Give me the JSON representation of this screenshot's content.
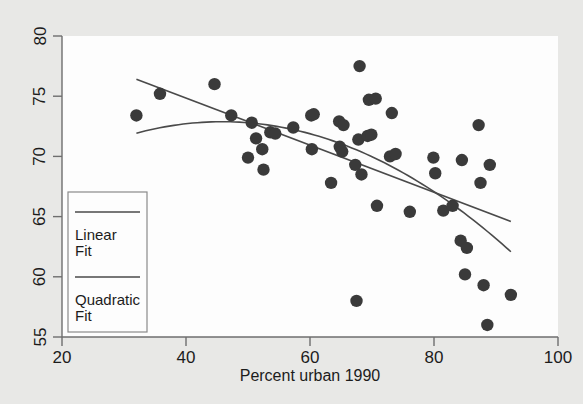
{
  "figure": {
    "background_color": "#e8e8e6",
    "plot_background_color": "#fdfdfd",
    "marker_color": "#3a3a3a",
    "line_color": "#4a4a4a",
    "frame_color": "#6e6e6e"
  },
  "chart_data": {
    "type": "scatter",
    "title": "",
    "xlabel": "Percent urban 1990",
    "ylabel": "",
    "xlim": [
      20,
      100
    ],
    "ylim": [
      55,
      80
    ],
    "xticks": [
      20,
      40,
      60,
      80,
      100
    ],
    "yticks": [
      55,
      60,
      65,
      70,
      75,
      80
    ],
    "xtick_labels": [
      "20",
      "40",
      "60",
      "80",
      "100"
    ],
    "ytick_labels": [
      "55",
      "60",
      "65",
      "70",
      "75",
      "80"
    ],
    "grid": false,
    "legend_position": "lower left",
    "legend": [
      {
        "label_line1": "Linear",
        "label_line2": "Fit",
        "kind": "line"
      },
      {
        "label_line1": "Quadratic",
        "label_line2": "Fit",
        "kind": "line"
      }
    ],
    "series": [
      {
        "name": "Observations",
        "kind": "scatter",
        "marker": "circle",
        "points": [
          [
            32.0,
            73.4
          ],
          [
            35.8,
            75.2
          ],
          [
            44.6,
            76.0
          ],
          [
            47.3,
            73.4
          ],
          [
            50.0,
            69.9
          ],
          [
            50.6,
            72.8
          ],
          [
            51.3,
            71.5
          ],
          [
            52.5,
            68.9
          ],
          [
            52.3,
            70.6
          ],
          [
            53.6,
            72.0
          ],
          [
            54.4,
            71.9
          ],
          [
            57.3,
            72.4
          ],
          [
            60.2,
            73.4
          ],
          [
            60.6,
            73.5
          ],
          [
            60.3,
            70.6
          ],
          [
            63.4,
            67.8
          ],
          [
            64.7,
            72.9
          ],
          [
            64.8,
            70.8
          ],
          [
            65.4,
            72.6
          ],
          [
            65.2,
            70.4
          ],
          [
            67.3,
            69.3
          ],
          [
            67.8,
            71.4
          ],
          [
            68.3,
            68.5
          ],
          [
            68.0,
            77.5
          ],
          [
            69.3,
            71.7
          ],
          [
            69.9,
            71.8
          ],
          [
            69.5,
            74.7
          ],
          [
            70.6,
            74.8
          ],
          [
            70.8,
            65.9
          ],
          [
            67.5,
            58.0
          ],
          [
            73.2,
            73.6
          ],
          [
            72.9,
            70.0
          ],
          [
            73.8,
            70.2
          ],
          [
            76.1,
            65.4
          ],
          [
            79.9,
            69.9
          ],
          [
            80.2,
            68.6
          ],
          [
            81.5,
            65.5
          ],
          [
            83.0,
            65.9
          ],
          [
            84.5,
            69.7
          ],
          [
            84.3,
            63.0
          ],
          [
            85.3,
            62.4
          ],
          [
            85.0,
            60.2
          ],
          [
            87.2,
            72.6
          ],
          [
            87.5,
            67.8
          ],
          [
            88.0,
            59.3
          ],
          [
            89.0,
            69.3
          ],
          [
            88.6,
            56.0
          ],
          [
            92.4,
            58.5
          ]
        ]
      },
      {
        "name": "Linear Fit",
        "kind": "line",
        "x_start": 32.0,
        "x_end": 92.4,
        "y_start": 76.4,
        "y_end": 64.6,
        "slope": -0.1954,
        "intercept": 82.65
      },
      {
        "name": "Quadratic Fit",
        "kind": "curve",
        "x_start": 32.0,
        "x_end": 92.4,
        "coefficients": {
          "a": -0.00498,
          "b": 0.4565,
          "c": 62.42
        },
        "y_start": 71.96,
        "y_end": 62.4
      }
    ]
  }
}
